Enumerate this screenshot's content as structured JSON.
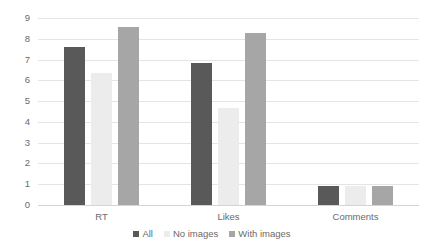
{
  "chart_data": {
    "type": "bar",
    "title": "",
    "xlabel": "",
    "ylabel": "",
    "categories": [
      "RT",
      "Likes",
      "Comments"
    ],
    "series": [
      {
        "name": "All",
        "color": "#595959",
        "values": [
          7.6,
          6.85,
          0.9
        ]
      },
      {
        "name": "No images",
        "color": "#ececec",
        "values": [
          6.35,
          4.65,
          0.9
        ]
      },
      {
        "name": "With images",
        "color": "#a6a6a6",
        "values": [
          8.55,
          8.3,
          0.9
        ]
      }
    ],
    "ylim": [
      0,
      9
    ],
    "y_ticks": [
      "0",
      "1",
      "2",
      "3",
      "4",
      "5",
      "6",
      "7",
      "8",
      "9"
    ],
    "grid": true,
    "legend_position": "bottom",
    "gridline_color": "#e4e4e4",
    "tick_label_color": "#6a6a6a",
    "background": "#ffffff"
  }
}
